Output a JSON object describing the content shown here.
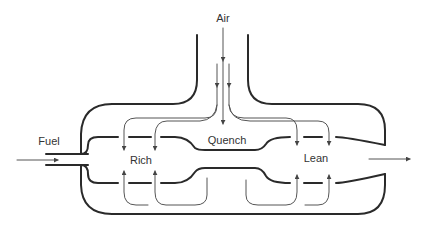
{
  "diagram": {
    "type": "rich-quench-lean combustor schematic",
    "labels": {
      "air": "Air",
      "fuel": "Fuel",
      "rich": "Rich",
      "quench": "Quench",
      "lean": "Lean"
    },
    "zones": [
      "Rich",
      "Quench",
      "Lean"
    ],
    "inlets": [
      "Air",
      "Fuel"
    ],
    "colors": {
      "stroke": "#2a2a2a",
      "flow": "#555555",
      "text": "#333333",
      "background": "#ffffff"
    }
  }
}
